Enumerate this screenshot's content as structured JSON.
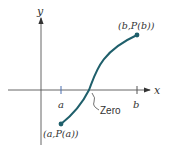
{
  "diagram": {
    "axes": {
      "x_label": "x",
      "y_label": "y"
    },
    "ticks": {
      "a": "a",
      "b": "b"
    },
    "points": {
      "start": "(a,P(a))",
      "end": "(b,P(b))"
    },
    "annotation": "Zero",
    "colors": {
      "curve": "#1f5f6b",
      "axis": "#444444",
      "tick": "#4a6fb0"
    }
  }
}
